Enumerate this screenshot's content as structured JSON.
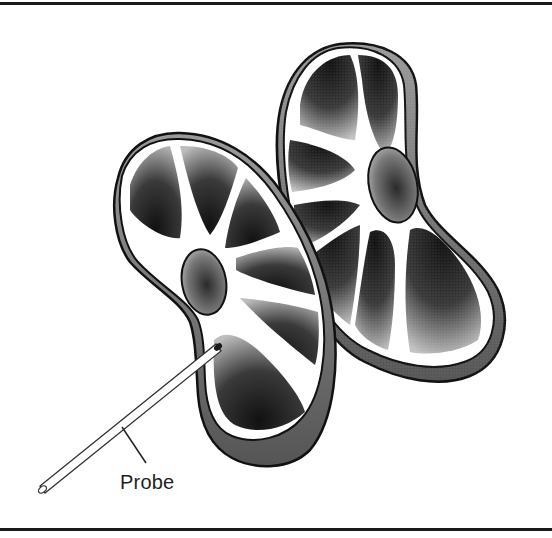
{
  "figure": {
    "type": "anatomical-illustration",
    "labels": [
      {
        "id": "probe",
        "text": "Probe"
      }
    ],
    "colors": {
      "ink": "#1a1a1a",
      "background": "#ffffff",
      "shade_dark": "#2b2b2b",
      "shade_mid": "#7a7a7a",
      "shade_light": "#c8c8c8"
    }
  }
}
